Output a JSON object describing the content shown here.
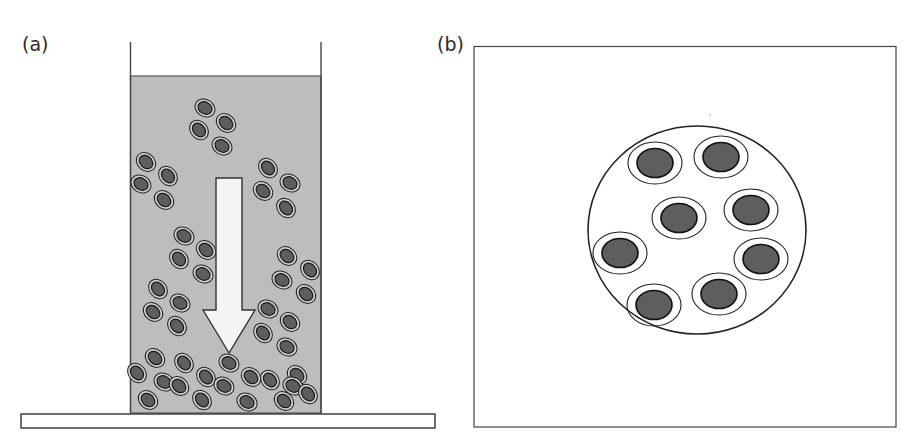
{
  "panels": {
    "a": {
      "label": "(a)",
      "description": "Cells sedimenting in a fluid-filled container onto a base plate",
      "colors": {
        "fluid": "#bdbdbd",
        "cell_core": "#5e5e5e",
        "cell_ring": "#d0d0d0",
        "arrow_fill": "#f4f4f4",
        "outline": "#333333"
      },
      "cells": [
        [
          205,
          108
        ],
        [
          226,
          123
        ],
        [
          199,
          130
        ],
        [
          222,
          146
        ],
        [
          146,
          162
        ],
        [
          168,
          176
        ],
        [
          141,
          184
        ],
        [
          164,
          200
        ],
        [
          268,
          168
        ],
        [
          290,
          183
        ],
        [
          263,
          191
        ],
        [
          286,
          208
        ],
        [
          184,
          236
        ],
        [
          206,
          250
        ],
        [
          179,
          259
        ],
        [
          203,
          274
        ],
        [
          287,
          256
        ],
        [
          310,
          270
        ],
        [
          282,
          280
        ],
        [
          306,
          294
        ],
        [
          158,
          289
        ],
        [
          180,
          303
        ],
        [
          153,
          312
        ],
        [
          177,
          326
        ],
        [
          268,
          309
        ],
        [
          290,
          322
        ],
        [
          263,
          333
        ],
        [
          287,
          347
        ],
        [
          155,
          358
        ],
        [
          184,
          363
        ],
        [
          229,
          363
        ],
        [
          297,
          375
        ],
        [
          137,
          373
        ],
        [
          164,
          382
        ],
        [
          179,
          386
        ],
        [
          206,
          377
        ],
        [
          224,
          386
        ],
        [
          251,
          377
        ],
        [
          270,
          380
        ],
        [
          293,
          386
        ],
        [
          148,
          400
        ],
        [
          202,
          400
        ],
        [
          247,
          402
        ],
        [
          284,
          401
        ],
        [
          308,
          394
        ]
      ]
    },
    "b": {
      "label": "(b)",
      "description": "Cells arranged within a circular region (top view)",
      "colors": {
        "cell_core": "#5e5e5e",
        "outline": "#222222"
      },
      "cells": [
        [
          655,
          163
        ],
        [
          721,
          157
        ],
        [
          679,
          218
        ],
        [
          751,
          210
        ],
        [
          620,
          253
        ],
        [
          761,
          259
        ],
        [
          654,
          305
        ],
        [
          719,
          294
        ]
      ]
    }
  }
}
